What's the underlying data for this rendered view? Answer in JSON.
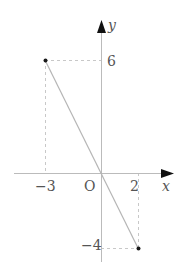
{
  "diagram": {
    "axes": {
      "x_label": "x",
      "y_label": "y",
      "origin_label": "O"
    },
    "ticks": {
      "x": [
        "−3",
        "2"
      ],
      "y": [
        "6",
        "−4"
      ]
    },
    "points": [
      {
        "label": "(-3, 6)",
        "x": -3,
        "y": 6
      },
      {
        "label": "(2, -4)",
        "x": 2,
        "y": -4
      }
    ],
    "line": {
      "from": [
        -3,
        6
      ],
      "to": [
        2,
        -4
      ],
      "equation": "y = -2x"
    },
    "colors": {
      "axis": "#bbbbbb",
      "line": "#b5b5b5",
      "dashed": "#c8c8c8",
      "point": "#1a1a1a",
      "arrow": "#111111",
      "label": "#555555"
    }
  }
}
